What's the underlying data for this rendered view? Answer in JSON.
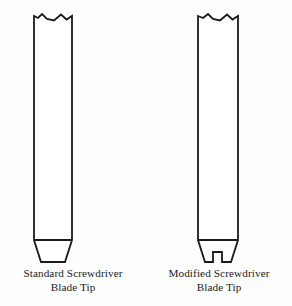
{
  "figure": {
    "background_color": "#fefefe",
    "line_color": "#1a1a1a",
    "fill_color": "#ffffff",
    "stroke_width": 1.8,
    "items": [
      {
        "id": "standard",
        "name": "standard-screwdriver-blade-tip",
        "caption_line1": "Standard Screwdriver",
        "caption_line2": "Blade Tip",
        "shaft_left_x": 34,
        "shaft_right_x": 72,
        "shaft_top_y": 14,
        "shoulder_y": 240,
        "tip_bottom_y": 262,
        "tip_bottom_left_x": 41,
        "tip_bottom_right_x": 65,
        "has_notch": false,
        "break_line": "jagged"
      },
      {
        "id": "modified",
        "name": "modified-screwdriver-blade-tip",
        "caption_line1": "Modified Screwdriver",
        "caption_line2": "Blade Tip",
        "shaft_left_x": 198,
        "shaft_right_x": 238,
        "shaft_top_y": 14,
        "shoulder_y": 240,
        "tip_bottom_y": 262,
        "tip_bottom_left_x": 205,
        "tip_bottom_right_x": 231,
        "has_notch": true,
        "notch_left_x": 213,
        "notch_right_x": 222,
        "notch_top_y": 252,
        "break_line": "jagged"
      }
    ]
  }
}
